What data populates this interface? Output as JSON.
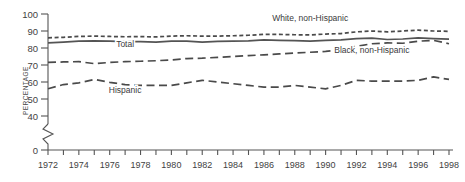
{
  "chart_data": {
    "type": "line",
    "title": "",
    "xlabel": "",
    "ylabel": "PERCENTAGE",
    "xlim": [
      1972,
      1998
    ],
    "ylim": [
      0,
      100
    ],
    "axis_break": {
      "from": 0,
      "to": 40,
      "note": "y-axis broken between 0 and 40"
    },
    "grid": false,
    "legend_position": "inline-annotations",
    "x": [
      1972,
      1973,
      1974,
      1975,
      1976,
      1977,
      1978,
      1979,
      1980,
      1981,
      1982,
      1983,
      1984,
      1985,
      1986,
      1987,
      1988,
      1989,
      1990,
      1991,
      1992,
      1993,
      1994,
      1995,
      1996,
      1997,
      1998
    ],
    "yticks": [
      0,
      40,
      50,
      60,
      70,
      80,
      90,
      100
    ],
    "ytick_labels": [
      "0",
      "40",
      "50",
      "60",
      "70",
      "80",
      "90",
      "100"
    ],
    "xticks": [
      1972,
      1973,
      1974,
      1975,
      1976,
      1977,
      1978,
      1979,
      1980,
      1981,
      1982,
      1983,
      1984,
      1985,
      1986,
      1987,
      1988,
      1989,
      1990,
      1991,
      1992,
      1993,
      1994,
      1995,
      1996,
      1997,
      1998
    ],
    "xtick_labels_shown": [
      "1972",
      "1974",
      "1976",
      "1978",
      "1980",
      "1982",
      "1984",
      "1986",
      "1988",
      "1990",
      "1992",
      "1994",
      "1996",
      "1998"
    ],
    "series": [
      {
        "name": "White, non-Hispanic",
        "label": "White, non-Hispanic",
        "style": "short-dash",
        "color": "#4a4a4a",
        "values": [
          86.0,
          86.3,
          86.8,
          87.0,
          86.8,
          86.6,
          86.7,
          86.5,
          87.0,
          87.2,
          87.0,
          87.0,
          87.2,
          87.5,
          88.0,
          88.0,
          87.8,
          87.7,
          88.2,
          88.5,
          89.5,
          90.0,
          89.5,
          90.0,
          90.5,
          90.0,
          89.8
        ]
      },
      {
        "name": "Total",
        "label": "Total",
        "style": "solid",
        "color": "#545454",
        "values": [
          83.0,
          83.4,
          84.0,
          84.2,
          84.0,
          83.7,
          83.8,
          83.5,
          84.0,
          84.0,
          83.5,
          83.9,
          84.0,
          84.2,
          84.8,
          84.5,
          84.3,
          84.0,
          84.5,
          84.8,
          85.5,
          85.8,
          85.0,
          85.3,
          86.0,
          85.5,
          85.2
        ]
      },
      {
        "name": "Black, non-Hispanic",
        "label": "Black, non-Hispanic",
        "style": "long-dash",
        "color": "#4a4a4a",
        "values": [
          71.5,
          71.8,
          72.0,
          70.8,
          71.5,
          72.0,
          72.2,
          72.5,
          73.0,
          73.8,
          74.0,
          74.5,
          75.0,
          75.5,
          76.0,
          76.5,
          77.0,
          77.5,
          78.0,
          79.0,
          81.0,
          82.5,
          83.0,
          82.8,
          84.0,
          84.5,
          82.5
        ]
      },
      {
        "name": "Hispanic",
        "label": "Hispanic",
        "style": "long-dash",
        "color": "#4a4a4a",
        "values": [
          56.0,
          58.5,
          59.5,
          61.5,
          59.8,
          58.5,
          58.0,
          58.0,
          58.0,
          59.5,
          61.0,
          60.0,
          59.0,
          58.0,
          57.0,
          57.0,
          58.0,
          57.0,
          56.0,
          58.0,
          61.0,
          60.5,
          60.5,
          60.5,
          61.0,
          63.0,
          61.5
        ]
      }
    ],
    "annotations": [
      {
        "text": "White, non-Hispanic",
        "x": 1989,
        "y": 96
      },
      {
        "text": "Total",
        "x": 1977,
        "y": 80.5
      },
      {
        "text": "Black, non-Hispanic",
        "x": 1993,
        "y": 77
      },
      {
        "text": "Hispanic",
        "x": 1977,
        "y": 53.5
      }
    ]
  },
  "axis": {
    "y_title": "PERCENTAGE"
  }
}
